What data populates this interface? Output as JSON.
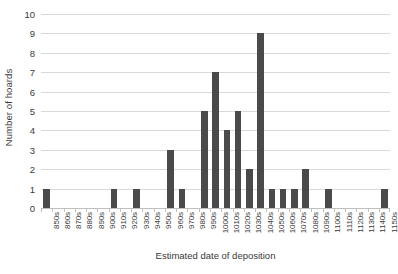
{
  "chart_data": {
    "type": "bar",
    "title": "",
    "xlabel": "Estimated date of deposition",
    "ylabel": "Number of hoards",
    "ylim": [
      0,
      10
    ],
    "ytick_step": 1,
    "yticks": [
      10,
      9,
      8,
      7,
      6,
      5,
      4,
      3,
      2,
      1,
      0
    ],
    "grid": true,
    "legend": "none",
    "bar_color": "#4a4a4a",
    "gridline_color": "#d9d9d9",
    "categories": [
      "850s",
      "860s",
      "870s",
      "880s",
      "890s",
      "900s",
      "910s",
      "920s",
      "930s",
      "940s",
      "950s",
      "960s",
      "970s",
      "980s",
      "990s",
      "1000s",
      "1010s",
      "1020s",
      "1030s",
      "1040s",
      "1050s",
      "1060s",
      "1070s",
      "1080s",
      "1090s",
      "1100s",
      "1110s",
      "1120s",
      "1130s",
      "1140s",
      "1150s"
    ],
    "values": [
      1,
      0,
      0,
      0,
      0,
      0,
      1,
      0,
      1,
      0,
      0,
      3,
      1,
      0,
      5,
      7,
      4,
      5,
      2,
      9,
      1,
      1,
      1,
      2,
      0,
      1,
      0,
      0,
      0,
      0,
      1
    ]
  }
}
